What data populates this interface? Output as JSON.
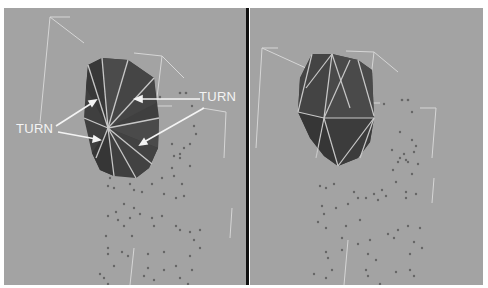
{
  "figure": {
    "panels": [
      {
        "id": "left",
        "description": "mesh with fan triangulation (edges meeting at one vertex)",
        "annotations": [
          {
            "text": "TURN",
            "position": "upper-right"
          },
          {
            "text": "TURN",
            "position": "left"
          }
        ]
      },
      {
        "id": "right",
        "description": "mesh with regular triangulation"
      }
    ],
    "colors": {
      "background": "#a3a3a3",
      "mesh_fill_dark": "#3c3c3c",
      "mesh_fill_mid": "#4a4a4a",
      "mesh_edge": "#c8c8c8",
      "lattice": "#d6d6d6",
      "particle": "#666666",
      "divider": "#111111",
      "label": "#f4f4f4"
    }
  },
  "labels": {
    "turn_right": "TURN",
    "turn_left": "TURN"
  }
}
